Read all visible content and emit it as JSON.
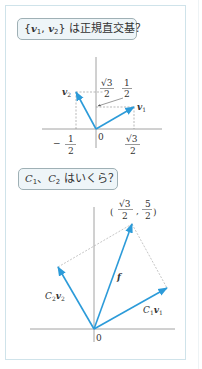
{
  "panel1": {
    "question": {
      "brace_open": "{",
      "v1": "v",
      "v1_sub": "1",
      "comma": ", ",
      "v2": "v",
      "v2_sub": "2",
      "brace_close": "}",
      "text": " は正規直交基？"
    },
    "diagram": {
      "origin_label": "0",
      "v1_label": "v",
      "v1_sub": "1",
      "v2_label": "v",
      "v2_sub": "2",
      "y_tick_sqrt3_over_2": {
        "num": "√3",
        "den": "2"
      },
      "y_tick_one_half": {
        "num": "1",
        "den": "2"
      },
      "x_tick_neg_half": {
        "sign": "−",
        "num": "1",
        "den": "2"
      },
      "x_tick_sqrt3_over_2": {
        "num": "√3",
        "den": "2"
      }
    }
  },
  "panel2": {
    "question": {
      "c1": "C",
      "c1_sub": "1",
      "sep": "、",
      "c2": "C",
      "c2_sub": "2",
      "text": " はいくら？"
    },
    "diagram": {
      "origin_label": "0",
      "f_label": "f",
      "c1v1_label": {
        "c": "C",
        "c_sub": "1",
        "v": "v",
        "v_sub": "1"
      },
      "c2v2_label": {
        "c": "C",
        "c_sub": "2",
        "v": "v",
        "v_sub": "2"
      },
      "point_label": {
        "open": "(",
        "x_num": "√3",
        "x_den": "2",
        "comma": ",",
        "y_num": "5",
        "y_den": "2",
        "close": ")"
      }
    }
  },
  "colors": {
    "vector": "#2c9bd9",
    "axis": "#8a8a8a",
    "dashed": "#8a8a8a",
    "outer_border": "#cfe3ea",
    "question_bg": "#eef5f8",
    "question_border": "#9fb0b5"
  }
}
